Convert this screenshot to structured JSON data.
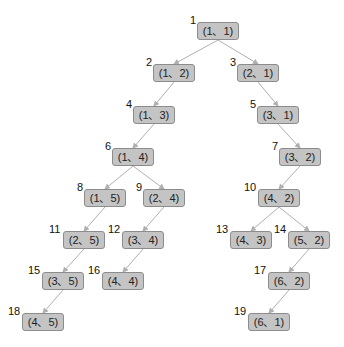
{
  "diagram": {
    "type": "tree",
    "colors": {
      "node_fill": "#c4c4c4",
      "node_border": "#8c8c8c",
      "edge": "#b0b0b0",
      "text": "#222222"
    },
    "nodes": [
      {
        "id": 1,
        "label": "(1、1)",
        "x": 197,
        "y": 22
      },
      {
        "id": 2,
        "label": "(1、2)",
        "x": 153,
        "y": 64
      },
      {
        "id": 3,
        "label": "(2、1)",
        "x": 237,
        "y": 64
      },
      {
        "id": 4,
        "label": "(1、3)",
        "x": 133,
        "y": 106
      },
      {
        "id": 5,
        "label": "(3、1)",
        "x": 257,
        "y": 106
      },
      {
        "id": 6,
        "label": "(1、4)",
        "x": 112,
        "y": 148
      },
      {
        "id": 7,
        "label": "(3、2)",
        "x": 279,
        "y": 148
      },
      {
        "id": 8,
        "label": "(1、5)",
        "x": 84,
        "y": 189
      },
      {
        "id": 9,
        "label": "(2、4)",
        "x": 143,
        "y": 189
      },
      {
        "id": 10,
        "label": "(4、2)",
        "x": 258,
        "y": 189
      },
      {
        "id": 11,
        "label": "(2、5)",
        "x": 63,
        "y": 231
      },
      {
        "id": 12,
        "label": "(3、4)",
        "x": 122,
        "y": 231
      },
      {
        "id": 13,
        "label": "(4、3)",
        "x": 230,
        "y": 231
      },
      {
        "id": 14,
        "label": "(5、2)",
        "x": 288,
        "y": 231
      },
      {
        "id": 15,
        "label": "(3、5)",
        "x": 42,
        "y": 272
      },
      {
        "id": 16,
        "label": "(4、4)",
        "x": 102,
        "y": 272
      },
      {
        "id": 17,
        "label": "(6、2)",
        "x": 268,
        "y": 272
      },
      {
        "id": 18,
        "label": "(4、5)",
        "x": 22,
        "y": 313
      },
      {
        "id": 19,
        "label": "(6、1)",
        "x": 248,
        "y": 313
      }
    ],
    "edges": [
      [
        1,
        2
      ],
      [
        1,
        3
      ],
      [
        2,
        4
      ],
      [
        3,
        5
      ],
      [
        4,
        6
      ],
      [
        5,
        7
      ],
      [
        6,
        8
      ],
      [
        6,
        9
      ],
      [
        7,
        10
      ],
      [
        8,
        11
      ],
      [
        9,
        12
      ],
      [
        10,
        13
      ],
      [
        10,
        14
      ],
      [
        11,
        15
      ],
      [
        12,
        16
      ],
      [
        14,
        17
      ],
      [
        15,
        18
      ],
      [
        17,
        19
      ]
    ]
  }
}
